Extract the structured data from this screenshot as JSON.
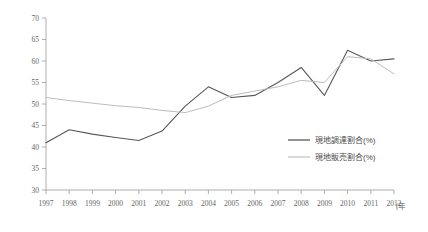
{
  "chart_data": {
    "type": "line",
    "title": "",
    "xlabel": "年",
    "ylabel": "",
    "ylim": [
      30,
      70
    ],
    "ytick_step": 5,
    "yticks": [
      "30",
      "35",
      "40",
      "45",
      "50",
      "55",
      "60",
      "65",
      "70"
    ],
    "grid": false,
    "legend_position": "center-right",
    "categories": [
      "1997",
      "1998",
      "1999",
      "2000",
      "2001",
      "2002",
      "2003",
      "2004",
      "2005",
      "2006",
      "2007",
      "2008",
      "2009",
      "2010",
      "2011",
      "2012"
    ],
    "series": [
      {
        "name": "現地調達割合(%)",
        "color": "#55585c",
        "values": [
          41.0,
          44.0,
          43.0,
          42.2,
          41.5,
          43.7,
          49.5,
          54.0,
          51.5,
          52.0,
          55.0,
          58.5,
          52.0,
          62.5,
          60.0,
          60.5
        ]
      },
      {
        "name": "現地販売割合(%)",
        "color": "#b9bcc0",
        "values": [
          51.5,
          50.8,
          50.2,
          49.6,
          49.2,
          48.5,
          48.0,
          49.5,
          52.0,
          53.0,
          54.0,
          55.5,
          55.0,
          61.0,
          60.5,
          57.0
        ]
      }
    ]
  },
  "legend": {
    "items": [
      {
        "label": "現地調達割合(%)",
        "color": "#55585c"
      },
      {
        "label": "現地販売割合(%)",
        "color": "#b9bcc0"
      }
    ]
  },
  "axes": {
    "x_unit_label": "(年"
  }
}
